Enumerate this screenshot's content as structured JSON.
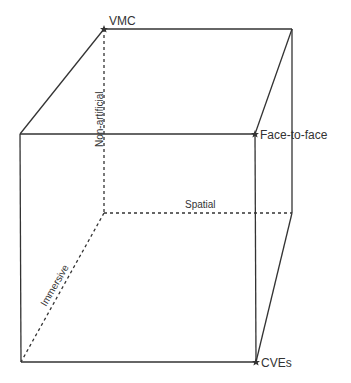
{
  "diagram": {
    "type": "cube",
    "colors": {
      "line": "#333333",
      "text": "#333333",
      "background": "#ffffff"
    },
    "corners": {
      "vmc": {
        "label": "VMC"
      },
      "face_to_face": {
        "label": "Face-to-face"
      },
      "cves": {
        "label": "CVEs"
      }
    },
    "axes": {
      "vertical": {
        "label": "Non-artificial"
      },
      "horizontal": {
        "label": "Spatial"
      },
      "depth": {
        "label": "Immersive"
      }
    }
  }
}
